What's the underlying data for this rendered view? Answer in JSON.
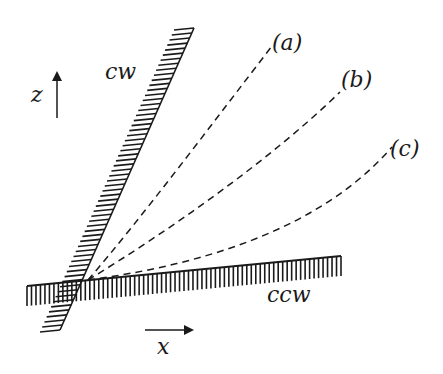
{
  "diagram": {
    "axes": {
      "z_label": "z",
      "x_label": "x"
    },
    "walls": [
      {
        "id": "cw",
        "label": "cw"
      },
      {
        "id": "ccw",
        "label": "ccw"
      }
    ],
    "curves": [
      {
        "id": "a",
        "label": "(a)"
      },
      {
        "id": "b",
        "label": "(b)"
      },
      {
        "id": "c",
        "label": "(c)"
      }
    ],
    "colors": {
      "ink": "#1a1a1a",
      "background": "#ffffff"
    }
  }
}
